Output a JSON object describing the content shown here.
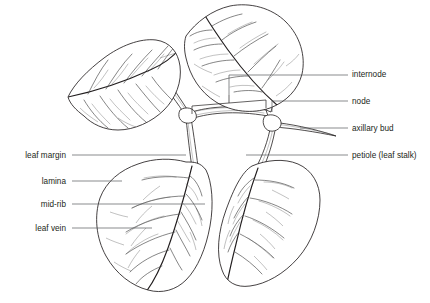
{
  "diagram": {
    "background_color": "#ffffff",
    "ink_color": "#231f20",
    "leader_color": "#58595b"
  },
  "labels_right": [
    {
      "id": "internode",
      "text": "internode",
      "x": 352,
      "y": 77,
      "line_from_x": 289,
      "line_to_x": 348,
      "line_y": 75
    },
    {
      "id": "node",
      "text": "node",
      "x": 352,
      "y": 104,
      "line_from_x": 289,
      "line_to_x": 348,
      "line_y": 101
    },
    {
      "id": "axillary-bud",
      "text": "axillary bud",
      "x": 352,
      "y": 131,
      "line_from_x": 300,
      "line_to_x": 348,
      "line_y": 128
    },
    {
      "id": "petiole",
      "text": "petiole (leaf stalk)",
      "x": 352,
      "y": 158,
      "line_from_x": 246,
      "line_to_x": 348,
      "line_y": 155
    }
  ],
  "labels_left": [
    {
      "id": "leaf-margin",
      "text": "leaf margin",
      "x": 66,
      "y": 158,
      "line_from_x": 72,
      "line_to_x": 186,
      "line_y": 155
    },
    {
      "id": "lamina",
      "text": "lamina",
      "x": 66,
      "y": 184,
      "line_from_x": 72,
      "line_to_x": 122,
      "line_y": 181
    },
    {
      "id": "mid-rib",
      "text": "mid-rib",
      "x": 66,
      "y": 207,
      "line_from_x": 72,
      "line_to_x": 205,
      "line_y": 204
    },
    {
      "id": "leaf-vein",
      "text": "leaf vein",
      "x": 66,
      "y": 231,
      "line_from_x": 72,
      "line_to_x": 152,
      "line_y": 228
    }
  ],
  "structures": {
    "leaves": [
      {
        "id": "upper-left-leaf",
        "name": "upper left leaf"
      },
      {
        "id": "upper-right-leaf",
        "name": "upper right leaf"
      },
      {
        "id": "lower-left-leaf",
        "name": "lower left leaf"
      },
      {
        "id": "lower-right-leaf",
        "name": "lower right leaf"
      }
    ],
    "stem": {
      "id": "main-stem",
      "name": "main stem"
    },
    "nodes": [
      {
        "id": "left-node",
        "x": 186,
        "y": 117
      },
      {
        "id": "right-node",
        "x": 272,
        "y": 124
      }
    ],
    "axillary_bud": {
      "id": "axillary-bud-spike",
      "x": 300,
      "y": 131
    },
    "internode_bracket": {
      "from_x": 192,
      "to_x": 266,
      "y": 110,
      "tick_x": 229,
      "tick_y": 95
    }
  }
}
